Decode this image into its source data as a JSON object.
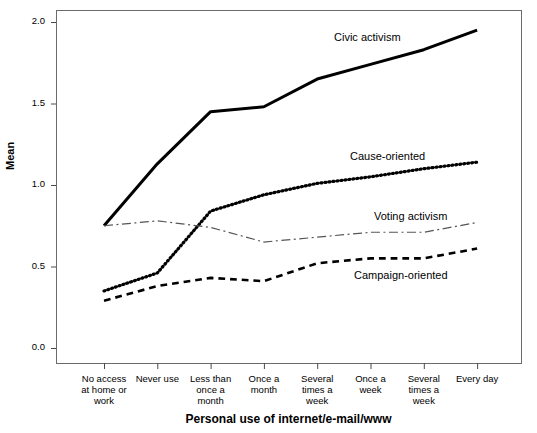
{
  "chart_data": {
    "type": "line",
    "title": "",
    "xlabel": "Personal use of internet/e-mail/www",
    "ylabel": "Mean",
    "ylim": [
      0.0,
      2.0
    ],
    "yticks": [
      "0.0",
      "0.5",
      "1.0",
      "1.5",
      "2.0"
    ],
    "ytick_values": [
      0.0,
      0.5,
      1.0,
      1.5,
      2.0
    ],
    "grid": false,
    "legend_position": "inline-annotations",
    "categories": [
      "No access at home or work",
      "Never use",
      "Less than once a month",
      "Once a month",
      "Several times a week",
      "Once a week",
      "Several times a week",
      "Every day"
    ],
    "category_lines": [
      [
        "No access",
        "at home or",
        "work"
      ],
      [
        "Never use"
      ],
      [
        "Less than",
        "once a",
        "month"
      ],
      [
        "Once a",
        "month"
      ],
      [
        "Several",
        "times a",
        "week"
      ],
      [
        "Once a",
        "week"
      ],
      [
        "Several",
        "times a",
        "week"
      ],
      [
        "Every day"
      ]
    ],
    "series": [
      {
        "name": "Civic activism",
        "style": "solid",
        "color": "#000000",
        "width": 3.0,
        "values": [
          0.75,
          1.13,
          1.45,
          1.48,
          1.65,
          1.74,
          1.83,
          1.95
        ]
      },
      {
        "name": "Cause-oriented",
        "style": "dotted",
        "color": "#000000",
        "width": 3.2,
        "values": [
          0.35,
          0.46,
          0.84,
          0.94,
          1.01,
          1.05,
          1.1,
          1.14
        ]
      },
      {
        "name": "Voting activism",
        "style": "dashdot",
        "color": "#555555",
        "width": 1.2,
        "values": [
          0.75,
          0.78,
          0.74,
          0.65,
          0.68,
          0.71,
          0.71,
          0.77
        ]
      },
      {
        "name": "Campaign-oriented",
        "style": "dashed",
        "color": "#000000",
        "width": 2.6,
        "values": [
          0.29,
          0.38,
          0.43,
          0.41,
          0.52,
          0.55,
          0.55,
          0.61
        ]
      }
    ],
    "annotations": [
      {
        "text": "Civic activism",
        "x": 334,
        "y": 31
      },
      {
        "text": "Cause-oriented",
        "x": 350,
        "y": 150
      },
      {
        "text": "Voting activism",
        "x": 374,
        "y": 210
      },
      {
        "text": "Campaign-oriented",
        "x": 354,
        "y": 269
      }
    ]
  },
  "axes": {
    "plot_left": 56,
    "plot_right": 521,
    "plot_top": 10,
    "plot_bottom": 363,
    "y_zero_px": 348,
    "y_two_px": 22,
    "first_tick_px": 104,
    "tick_spacing_px": 53.3
  },
  "fragment": {
    "top_clipped_text": ""
  }
}
